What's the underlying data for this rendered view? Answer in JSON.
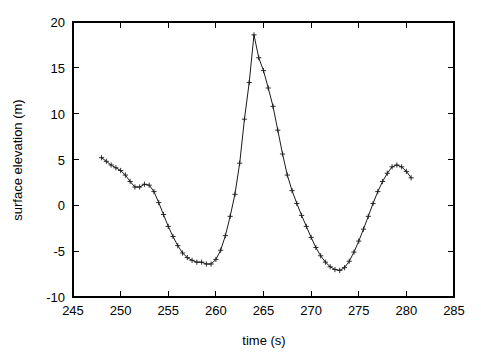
{
  "chart_data": {
    "type": "line",
    "title": "",
    "subtitle": "",
    "xlabel": "time (s)",
    "ylabel": "surface elevation (m)",
    "xlim": [
      245,
      285
    ],
    "ylim": [
      -10,
      20
    ],
    "xticks": [
      245,
      250,
      255,
      260,
      265,
      270,
      275,
      280,
      285
    ],
    "xtick_labels": [
      "245",
      "250",
      "255",
      "260",
      "265",
      "270",
      "275",
      "280",
      "285"
    ],
    "yticks": [
      -10,
      -5,
      0,
      5,
      10,
      15,
      20
    ],
    "ytick_labels": [
      "-10",
      "-5",
      "0",
      "5",
      "10",
      "15",
      "20"
    ],
    "grid": false,
    "legend": null,
    "legend_position": "none",
    "marker": "+",
    "line_color": "#1a1a1a",
    "series": [
      {
        "name": "surface elevation",
        "x": [
          248.0,
          248.5,
          249.0,
          249.5,
          250.0,
          250.5,
          251.0,
          251.5,
          252.0,
          252.5,
          253.0,
          253.5,
          254.0,
          254.5,
          255.0,
          255.5,
          256.0,
          256.5,
          257.0,
          257.5,
          258.0,
          258.5,
          259.0,
          259.5,
          260.0,
          260.5,
          261.0,
          261.5,
          262.0,
          262.5,
          263.0,
          263.5,
          264.0,
          264.5,
          265.0,
          265.5,
          266.0,
          266.5,
          267.0,
          267.5,
          268.0,
          268.5,
          269.0,
          269.5,
          270.0,
          270.5,
          271.0,
          271.5,
          272.0,
          272.5,
          273.0,
          273.5,
          274.0,
          274.5,
          275.0,
          275.5,
          276.0,
          276.5,
          277.0,
          277.5,
          278.0,
          278.5,
          279.0,
          279.5,
          280.0,
          280.5
        ],
        "y": [
          5.2,
          4.8,
          4.4,
          4.1,
          3.8,
          3.3,
          2.6,
          2.0,
          2.0,
          2.3,
          2.2,
          1.5,
          0.3,
          -1.0,
          -2.3,
          -3.4,
          -4.4,
          -5.2,
          -5.7,
          -6.0,
          -6.2,
          -6.2,
          -6.4,
          -6.4,
          -5.9,
          -4.9,
          -3.3,
          -1.2,
          1.2,
          4.6,
          9.4,
          13.4,
          18.6,
          16.1,
          14.7,
          12.8,
          10.8,
          8.2,
          5.6,
          3.3,
          1.6,
          0.2,
          -1.1,
          -2.3,
          -3.5,
          -4.6,
          -5.5,
          -6.2,
          -6.7,
          -7.0,
          -7.1,
          -6.8,
          -6.1,
          -5.1,
          -3.9,
          -2.6,
          -1.2,
          0.2,
          1.5,
          2.6,
          3.5,
          4.2,
          4.4,
          4.2,
          3.7,
          3.0
        ]
      }
    ],
    "annotations": []
  }
}
